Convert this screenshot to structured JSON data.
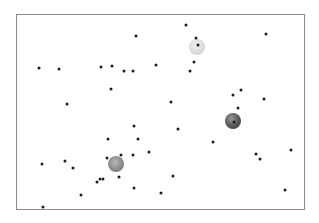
{
  "arena": {
    "frame": {
      "left": 16,
      "top": 14,
      "right": 305,
      "bottom": 210,
      "border_color": "#8a8a8a"
    },
    "background": "#ffffff"
  },
  "spheres": [
    {
      "name": "light-sphere",
      "x": 197,
      "y": 47,
      "r": 8,
      "tone": "light"
    },
    {
      "name": "dark-sphere",
      "x": 233,
      "y": 121,
      "r": 8,
      "tone": "dark"
    },
    {
      "name": "medium-sphere",
      "x": 116,
      "y": 164,
      "r": 8,
      "tone": "medium"
    }
  ],
  "dots": [
    [
      186,
      25
    ],
    [
      266,
      34
    ],
    [
      136,
      36
    ],
    [
      196,
      38
    ],
    [
      198,
      45
    ],
    [
      194,
      62
    ],
    [
      156,
      65
    ],
    [
      112,
      66
    ],
    [
      101,
      67
    ],
    [
      39,
      68
    ],
    [
      59,
      69
    ],
    [
      190,
      71
    ],
    [
      124,
      71
    ],
    [
      133,
      71
    ],
    [
      111,
      89
    ],
    [
      241,
      90
    ],
    [
      233,
      95
    ],
    [
      264,
      99
    ],
    [
      171,
      102
    ],
    [
      67,
      104
    ],
    [
      238,
      108
    ],
    [
      234,
      122
    ],
    [
      134,
      126
    ],
    [
      178,
      129
    ],
    [
      108,
      139
    ],
    [
      138,
      139
    ],
    [
      213,
      142
    ],
    [
      291,
      150
    ],
    [
      149,
      152
    ],
    [
      256,
      154
    ],
    [
      121,
      155
    ],
    [
      133,
      155
    ],
    [
      107,
      158
    ],
    [
      260,
      159
    ],
    [
      65,
      161
    ],
    [
      42,
      164
    ],
    [
      73,
      168
    ],
    [
      173,
      176
    ],
    [
      119,
      177
    ],
    [
      100,
      179
    ],
    [
      103,
      179
    ],
    [
      97,
      182
    ],
    [
      134,
      188
    ],
    [
      285,
      190
    ],
    [
      161,
      193
    ],
    [
      81,
      195
    ],
    [
      43,
      207
    ]
  ],
  "dot_color": "#1e1e1e"
}
